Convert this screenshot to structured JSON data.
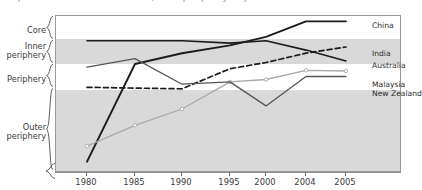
{
  "title": "Graph 1: Asia-Pacific economies, core–periphery trajectories",
  "chart_data": {
    "type": "line",
    "title": "Graph 1: Asia-Pacific economies, core–periphery trajectories",
    "xlabel": "",
    "ylabel": "",
    "grid": false,
    "legend_position": "right-inline",
    "x": [
      "1980",
      "1985",
      "1990",
      "1995",
      "2000",
      "2004",
      "2005"
    ],
    "y_categories": [
      {
        "label": "Core",
        "band": "white",
        "top_pct": 0.0,
        "bottom_pct": 14.6
      },
      {
        "label": "Inner periphery",
        "band": "gray",
        "top_pct": 14.6,
        "bottom_pct": 30.6
      },
      {
        "label": "Periphery",
        "band": "white",
        "top_pct": 30.6,
        "bottom_pct": 47.1
      },
      {
        "label": "Outer periphery",
        "band": "gray",
        "top_pct": 47.1,
        "bottom_pct": 100.0
      }
    ],
    "ylim_note": "ordinal bands, 0 = top of Core, 100 = bottom of Outer periphery",
    "series": [
      {
        "name": "China",
        "style": "solid",
        "color": "#1c1c1c",
        "width": 1.9,
        "markers": false,
        "values": [
          94.0,
          31.0,
          24.0,
          19.0,
          13.5,
          3.5,
          3.5
        ]
      },
      {
        "name": "Australia",
        "style": "solid",
        "color": "#1c1c1c",
        "width": 1.6,
        "markers": false,
        "values": [
          16.0,
          16.0,
          16.0,
          17.5,
          16.0,
          22.0,
          29.0
        ]
      },
      {
        "name": "India",
        "style": "dashed",
        "color": "#1c1c1c",
        "width": 1.7,
        "markers": false,
        "values": [
          46.0,
          46.5,
          47.0,
          34.0,
          30.0,
          24.0,
          20.0
        ]
      },
      {
        "name": "Malaysia",
        "style": "solid",
        "color": "#a9a9a9",
        "width": 1.3,
        "markers": true,
        "values": [
          84.0,
          70.5,
          60.0,
          42.5,
          41.0,
          35.0,
          35.5
        ]
      },
      {
        "name": "New Zealand",
        "style": "solid",
        "color": "#555555",
        "width": 1.3,
        "markers": false,
        "values": [
          33.0,
          27.5,
          44.0,
          42.5,
          58.0,
          39.0,
          39.0
        ]
      }
    ],
    "series_labels": [
      {
        "name": "China",
        "x_px": 372,
        "y_px": 22
      },
      {
        "name": "India",
        "x_px": 372,
        "y_px": 50
      },
      {
        "name": "Australia",
        "x_px": 372,
        "y_px": 62
      },
      {
        "name": "Malaysia",
        "x_px": 372,
        "y_px": 81
      },
      {
        "name": "New Zealand",
        "x_px": 372,
        "y_px": 90
      }
    ],
    "xtick_px": [
      86,
      134,
      181,
      229,
      265,
      305,
      345
    ]
  }
}
